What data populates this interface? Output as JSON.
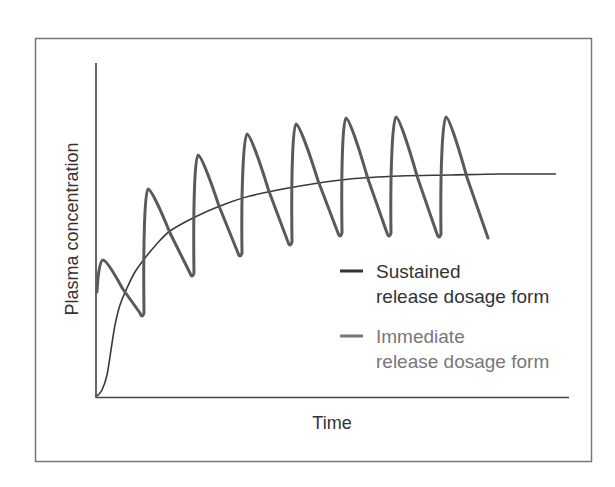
{
  "chart_data": {
    "type": "line",
    "title": "",
    "xlabel": "Time",
    "ylabel": "Plasma concentration",
    "grid": false,
    "axis_ticks": "none",
    "legend_position": "lower-right inside plot",
    "series": [
      {
        "name": "Sustained release dosage form",
        "legend_lines": [
          "Sustained",
          "release dosage form"
        ],
        "color": "#333333",
        "shape": "smooth rise to plateau",
        "points_px": [
          [
            97,
            396
          ],
          [
            102,
            390
          ],
          [
            107,
            375
          ],
          [
            111,
            350
          ],
          [
            115,
            325
          ],
          [
            120,
            305
          ],
          [
            127,
            288
          ],
          [
            135,
            272
          ],
          [
            145,
            258
          ],
          [
            155,
            246
          ],
          [
            170,
            231
          ],
          [
            195,
            217
          ],
          [
            220,
            206
          ],
          [
            250,
            196
          ],
          [
            300,
            186
          ],
          [
            350,
            179
          ],
          [
            400,
            176
          ],
          [
            450,
            175
          ],
          [
            500,
            174
          ],
          [
            556,
            174
          ]
        ]
      },
      {
        "name": "Immediate release dosage form",
        "legend_lines": [
          "Immediate",
          "release dosage form"
        ],
        "color": "#5c5c5c",
        "shape": "sawtooth oscillation (repeated doses) with rising peaks converging",
        "peaks_px": [
          [
            103,
            260
          ],
          [
            148,
            189
          ],
          [
            198,
            155
          ],
          [
            247,
            134
          ],
          [
            296,
            124
          ],
          [
            346,
            118
          ],
          [
            396,
            117
          ],
          [
            446,
            117
          ]
        ],
        "troughs_px": [
          [
            97,
            292
          ],
          [
            142,
            317
          ],
          [
            192,
            277
          ],
          [
            240,
            257
          ],
          [
            290,
            246
          ],
          [
            340,
            237
          ],
          [
            389,
            237
          ],
          [
            439,
            238
          ]
        ],
        "end_px": [
          488,
          238
        ]
      }
    ]
  },
  "legend": {
    "items": [
      {
        "line1": "Sustained",
        "line2": "release dosage form",
        "color": "#333333",
        "text_color": "#333333"
      },
      {
        "line1": "Immediate",
        "line2": "release dosage form",
        "color": "#777777",
        "text_color": "#777777"
      }
    ]
  },
  "axes": {
    "x_label": "Time",
    "y_label": "Plasma concentration"
  }
}
